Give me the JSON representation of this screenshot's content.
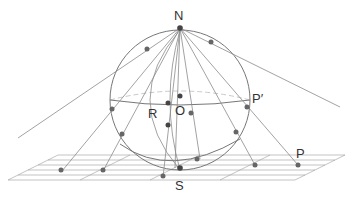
{
  "figure": {
    "type": "stereographic-projection",
    "labels": {
      "north": "N",
      "south": "S",
      "center": "O",
      "point_r": "R",
      "point_p_prime": "P′",
      "point_p": "P"
    },
    "colors": {
      "line": "#8a8a8a",
      "sphere": "#777777",
      "point": "#666666",
      "label": "#333333",
      "background": "#ffffff"
    }
  }
}
